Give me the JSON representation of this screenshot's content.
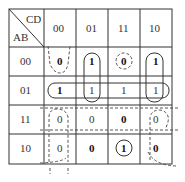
{
  "header": {
    "col_var": "CD",
    "row_var": "AB"
  },
  "columns": [
    "00",
    "01",
    "11",
    "10"
  ],
  "rows": [
    {
      "label": "00",
      "cells": [
        "0",
        "1",
        "0",
        "1"
      ]
    },
    {
      "label": "01",
      "cells": [
        "1",
        "1",
        "1",
        "1"
      ]
    },
    {
      "label": "11",
      "cells": [
        "0",
        "0",
        "0",
        "0"
      ]
    },
    {
      "label": "10",
      "cells": [
        "0",
        "0",
        "1",
        "0"
      ]
    }
  ],
  "groups": {
    "ones": [
      {
        "name": "row-01-all",
        "style": "solid"
      },
      {
        "name": "col-01-rows-00-01",
        "style": "solid"
      },
      {
        "name": "col-10-rows-00-01",
        "style": "solid"
      },
      {
        "name": "single-1010",
        "style": "solid"
      }
    ],
    "zeros": [
      {
        "name": "col-00-rows-00",
        "style": "dashed"
      },
      {
        "name": "single-0011",
        "style": "dashed"
      },
      {
        "name": "row-11-all",
        "style": "dashed"
      },
      {
        "name": "col-00-rows-11-10",
        "style": "dashed"
      },
      {
        "name": "corner-10-col-10",
        "style": "dashed"
      }
    ]
  }
}
